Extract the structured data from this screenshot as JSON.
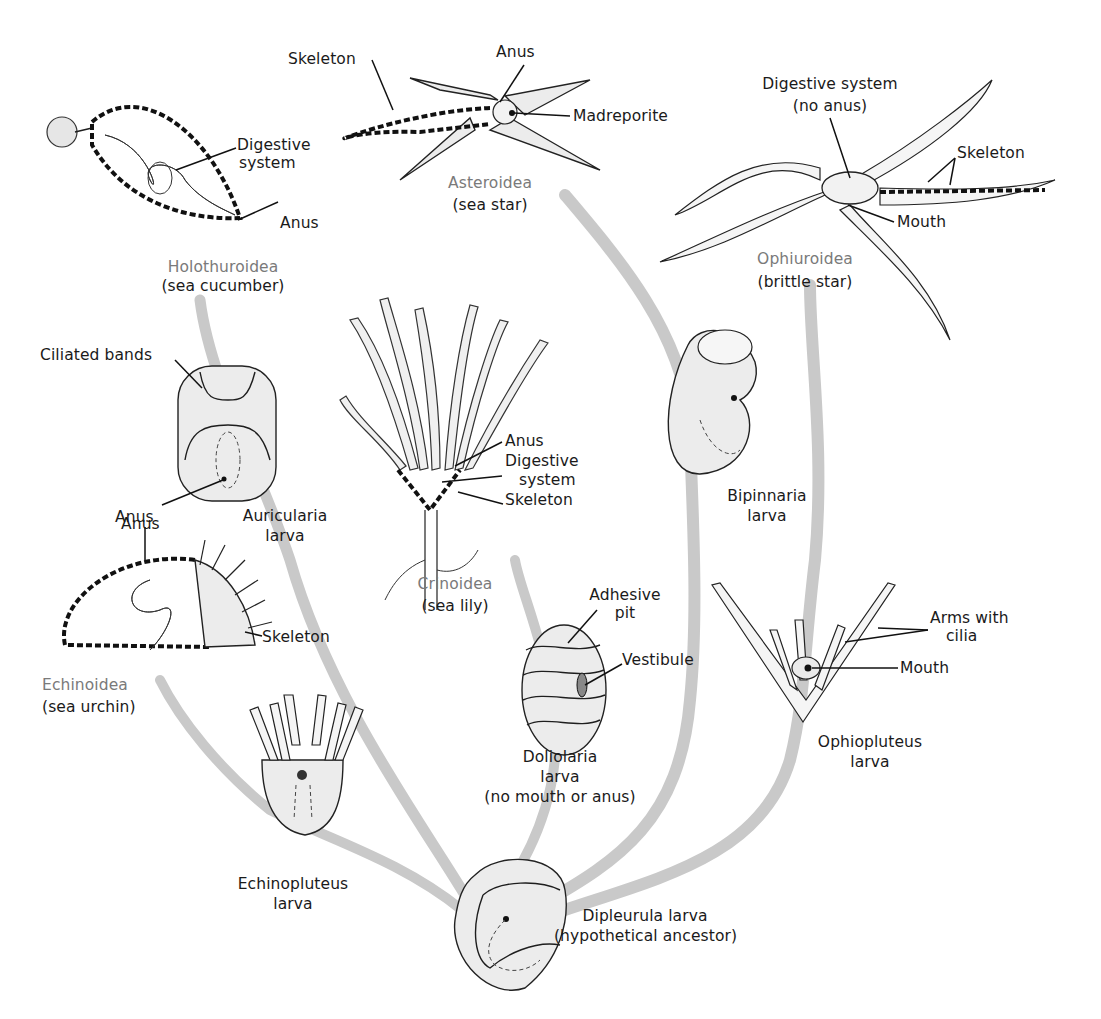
{
  "figure": {
    "colors": {
      "branch": "#c9c9c9",
      "class_label": "#7a7a7a",
      "label": "#1a1a1a",
      "ink": "#1e1e1e"
    },
    "ancestor": {
      "name": "Dipleurula larva",
      "note": "(hypothetical ancestor)"
    },
    "classes": [
      {
        "id": "holothuroidea",
        "class_name": "Holothuroidea",
        "common_name": "(sea cucumber)",
        "annotations": [
          "Digestive",
          "system",
          "Anus"
        ],
        "larva": {
          "name": "Auricularia",
          "suffix": "larva",
          "annotations": [
            "Ciliated bands",
            "Anus"
          ]
        }
      },
      {
        "id": "asteroidea",
        "class_name": "Asteroidea",
        "common_name": "(sea star)",
        "annotations": [
          "Skeleton",
          "Anus",
          "Madreporite"
        ],
        "larva": {
          "name": "Bipinnaria",
          "suffix": "larva"
        }
      },
      {
        "id": "ophiuroidea",
        "class_name": "Ophiuroidea",
        "common_name": "(brittle star)",
        "annotations": [
          "Digestive system",
          "(no anus)",
          "Skeleton",
          "Mouth"
        ],
        "larva": {
          "name": "Ophiopluteus",
          "suffix": "larva",
          "annotations": [
            "Arms with",
            "cilia",
            "Mouth"
          ]
        }
      },
      {
        "id": "crinoidea",
        "class_name": "Crinoidea",
        "common_name": "(sea lily)",
        "annotations": [
          "Anus",
          "Digestive",
          "system",
          "Skeleton"
        ],
        "larva": {
          "name": "Doliolaria",
          "suffix": "larva",
          "note": "(no mouth or anus)",
          "annotations": [
            "Adhesive",
            "pit",
            "Vestibule"
          ]
        }
      },
      {
        "id": "echinoidea",
        "class_name": "Echinoidea",
        "common_name": "(sea urchin)",
        "annotations": [
          "Anus",
          "Skeleton"
        ],
        "larva": {
          "name": "Echinopluteus",
          "suffix": "larva"
        }
      }
    ]
  }
}
